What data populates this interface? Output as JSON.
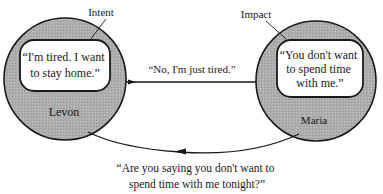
{
  "diagram": {
    "title": "",
    "colors": {
      "circle_fill": "#a9a9a9",
      "stroke": "#1a1a1a",
      "bubble_fill": "#ffffff",
      "text": "#1a1a1a"
    },
    "nodes": [
      {
        "id": "levon",
        "name": "Levon",
        "callout_label": "Intent",
        "bubble_lines": [
          "“I'm tired. I want",
          "to stay home.”"
        ]
      },
      {
        "id": "maria",
        "name": "Maria",
        "callout_label": "Impact",
        "bubble_lines": [
          "“You don't want",
          "to spend time",
          "with me.”"
        ]
      }
    ],
    "edges": [
      {
        "from": "levon",
        "to": "maria",
        "label_lines": [
          "“No, I'm just tired.”"
        ]
      },
      {
        "from": "maria",
        "to": "levon",
        "label_lines": [
          "“Are you saying you don't want to",
          "spend time with me tonight?”"
        ]
      }
    ]
  }
}
